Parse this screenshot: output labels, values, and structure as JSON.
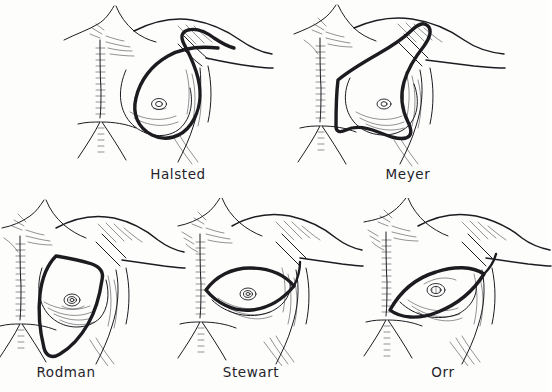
{
  "plate": {
    "title": "Mastectomy skin incision types",
    "background_color": "#fdfdfc",
    "ink_color": "#1d1b20",
    "style": "hand-drawn medical line illustration",
    "layout": {
      "rows": 2,
      "top_row_count": 2,
      "bottom_row_count": 3
    }
  },
  "panels": [
    {
      "id": "halsted",
      "label": "Halsted",
      "incision_shape": "teardrop / vertical oval with superior tail extending to the axilla",
      "row": 1,
      "column": 1
    },
    {
      "id": "meyer",
      "label": "Meyer",
      "incision_shape": "oblique elliptical incision tilted toward the shoulder",
      "row": 1,
      "column": 2
    },
    {
      "id": "rodman",
      "label": "Rodman",
      "incision_shape": "near-vertical ellipse with straight superior border",
      "row": 2,
      "column": 1
    },
    {
      "id": "stewart",
      "label": "Stewart",
      "incision_shape": "horizontal transverse ellipse",
      "row": 2,
      "column": 2
    },
    {
      "id": "orr",
      "label": "Orr",
      "incision_shape": "oblique ellipse angled upward toward the axilla",
      "row": 2,
      "column": 3
    }
  ]
}
